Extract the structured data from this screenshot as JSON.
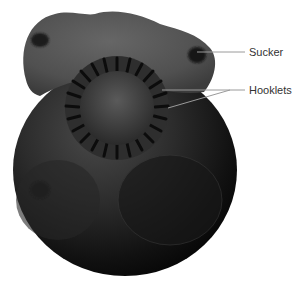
{
  "figure": {
    "labels": [
      {
        "id": "sucker",
        "text": "Sucker"
      },
      {
        "id": "hooklets",
        "text": "Hooklets"
      }
    ],
    "colors": {
      "background": "#ffffff",
      "specimen_dark": "#0a0a0a",
      "specimen_mid": "#3a3a3a",
      "specimen_light": "#5e5e5e",
      "leader_line": "#9a9a9a",
      "label_text": "#333333"
    }
  }
}
